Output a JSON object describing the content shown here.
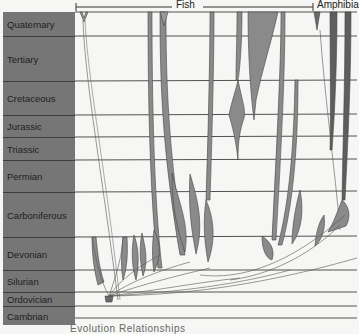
{
  "header": {
    "groups": [
      {
        "label": "Fish",
        "x_start": 77,
        "x_end": 313,
        "label_x": 182
      },
      {
        "label": "Amphibia",
        "x_start": 313,
        "x_end": 357,
        "label_x": 318
      }
    ]
  },
  "periods": [
    {
      "label": "Quaternary",
      "y_top": 12,
      "y_bottom": 36
    },
    {
      "label": "Tertiary",
      "y_top": 36,
      "y_bottom": 81
    },
    {
      "label": "Cretaceous",
      "y_top": 81,
      "y_bottom": 115
    },
    {
      "label": "Jurassic",
      "y_top": 115,
      "y_bottom": 137
    },
    {
      "label": "Triassic",
      "y_top": 137,
      "y_bottom": 160
    },
    {
      "label": "Permian",
      "y_top": 160,
      "y_bottom": 192
    },
    {
      "label": "Carboniferous",
      "y_top": 192,
      "y_bottom": 237
    },
    {
      "label": "Devonian",
      "y_top": 237,
      "y_bottom": 270
    },
    {
      "label": "Silurian",
      "y_top": 270,
      "y_bottom": 292
    },
    {
      "label": "Ordovician",
      "y_top": 292,
      "y_bottom": 306
    },
    {
      "label": "Cambrian",
      "y_top": 306,
      "y_bottom": 325
    }
  ],
  "caption": "Evolution   Relationships",
  "colors": {
    "period_column": "#767676",
    "lineage_fill": "#8a8a8a",
    "lineage_dark": "#555555",
    "gridline": "#3e3e3e",
    "background": "#f6f6f4"
  }
}
